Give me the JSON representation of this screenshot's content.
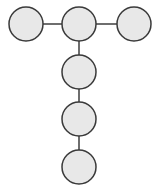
{
  "figure": {
    "title": "",
    "type": "node-link-tree-diagram",
    "width": 160,
    "height": 186,
    "background_color": "#ffffff"
  },
  "style": {
    "node_fill": "#e8e8e8",
    "node_stroke": "#3a3a3a",
    "node_stroke_width": 1.5,
    "node_radius": 17,
    "edge_color": "#4a4a4a",
    "edge_width": 1.6
  },
  "graph": {
    "nodes": [
      {
        "id": "n1",
        "label": "",
        "cx": 26,
        "cy": 24,
        "r": 17,
        "role": "top-left-leaf"
      },
      {
        "id": "n2",
        "label": "",
        "cx": 79,
        "cy": 24,
        "r": 17,
        "role": "top-center-hub"
      },
      {
        "id": "n3",
        "label": "",
        "cx": 134,
        "cy": 24,
        "r": 17,
        "role": "top-right-leaf"
      },
      {
        "id": "n4",
        "label": "",
        "cx": 79,
        "cy": 72,
        "r": 17,
        "role": "chain-1"
      },
      {
        "id": "n5",
        "label": "",
        "cx": 79,
        "cy": 119,
        "r": 17,
        "role": "chain-2"
      },
      {
        "id": "n6",
        "label": "",
        "cx": 79,
        "cy": 167,
        "r": 17,
        "role": "chain-3-bottom-leaf"
      }
    ],
    "edges": [
      {
        "id": "e1",
        "from": "n1",
        "to": "n2",
        "x1": 43,
        "y1": 24,
        "x2": 62,
        "y2": 24
      },
      {
        "id": "e2",
        "from": "n2",
        "to": "n3",
        "x1": 96,
        "y1": 24,
        "x2": 117,
        "y2": 24
      },
      {
        "id": "e3",
        "from": "n2",
        "to": "n4",
        "x1": 79,
        "y1": 41,
        "x2": 79,
        "y2": 55
      },
      {
        "id": "e4",
        "from": "n4",
        "to": "n5",
        "x1": 79,
        "y1": 89,
        "x2": 79,
        "y2": 102
      },
      {
        "id": "e5",
        "from": "n5",
        "to": "n6",
        "x1": 79,
        "y1": 136,
        "x2": 79,
        "y2": 150
      }
    ]
  }
}
